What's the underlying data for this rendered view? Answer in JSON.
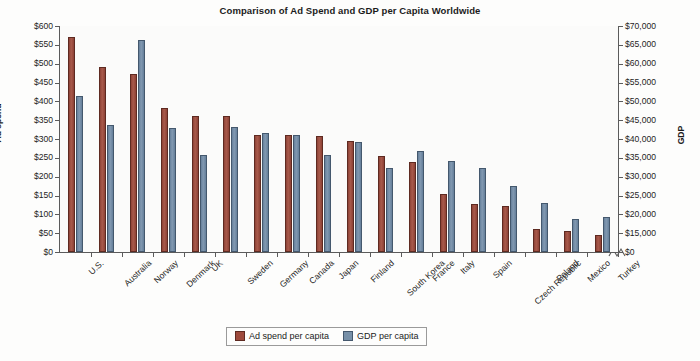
{
  "chart_data": {
    "type": "bar",
    "title": "Comparison of Ad Spend and GDP per Capita Worldwide",
    "xlabel": "",
    "ylabel": "Ad spend",
    "y2label": "GDP",
    "grid": false,
    "legend_position": "bottom-center",
    "ylim": [
      0,
      600
    ],
    "y2lim": [
      0,
      70000
    ],
    "yticks": [
      "$0",
      "$50",
      "$100",
      "$150",
      "$200",
      "$250",
      "$300",
      "$350",
      "$400",
      "$450",
      "$500",
      "$550",
      "$600"
    ],
    "y2ticks": [
      "$0",
      "$15,000",
      "$20,000",
      "$25,000",
      "$30,000",
      "$35,000",
      "$40,000",
      "$45,000",
      "$50,000",
      "$55,000",
      "$60,000",
      "$65,000",
      "$70,000"
    ],
    "y2_axis_break": true,
    "categories": [
      "U.S.",
      "Australia",
      "Norway",
      "Denmark",
      "UK",
      "Sweden",
      "Germany",
      "Canada",
      "Japan",
      "Finland",
      "South Korea",
      "France",
      "Italy",
      "Spain",
      "Czech Republic",
      "Poland",
      "Mexico",
      "Turkey"
    ],
    "series": [
      {
        "name": "Ad spend per capita",
        "color": "#9E4A3C",
        "axis": "left",
        "values": [
          570,
          490,
          472,
          383,
          362,
          362,
          310,
          310,
          307,
          295,
          255,
          238,
          155,
          127,
          122,
          60,
          55,
          45
        ]
      },
      {
        "name": "GDP per capita",
        "color": "#7790A8",
        "axis": "right",
        "values": [
          48000,
          39000,
          65000,
          38500,
          30000,
          38500,
          36500,
          36000,
          30000,
          34000,
          25500,
          31000,
          28000,
          26000,
          20500,
          15000,
          10500,
          11000
        ],
        "values_left_scale": [
          415,
          338,
          562,
          330,
          258,
          333,
          315,
          310,
          258,
          293,
          222,
          268,
          242,
          223,
          175,
          130,
          88,
          93
        ]
      }
    ]
  },
  "legend": {
    "items": [
      {
        "label": "Ad spend per capita",
        "key": "ad"
      },
      {
        "label": "GDP per capita",
        "key": "gdp"
      }
    ]
  }
}
